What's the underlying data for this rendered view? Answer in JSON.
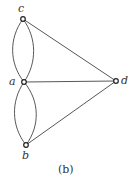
{
  "diagram": {
    "type": "multigraph",
    "caption": "(b)",
    "vertices": [
      {
        "id": "c",
        "label": "c",
        "x": 23,
        "y": 19,
        "lx": 18,
        "ly": 12
      },
      {
        "id": "a",
        "label": "a",
        "x": 24,
        "y": 82,
        "lx": 9,
        "ly": 85
      },
      {
        "id": "d",
        "label": "d",
        "x": 116,
        "y": 81,
        "lx": 121,
        "ly": 84
      },
      {
        "id": "b",
        "label": "b",
        "x": 26,
        "y": 145,
        "lx": 22,
        "ly": 159
      }
    ],
    "edges": [
      {
        "from": "c",
        "to": "a",
        "kind": "curved-left"
      },
      {
        "from": "c",
        "to": "a",
        "kind": "curved-right"
      },
      {
        "from": "a",
        "to": "b",
        "kind": "curved-left"
      },
      {
        "from": "a",
        "to": "b",
        "kind": "curved-right"
      },
      {
        "from": "c",
        "to": "d",
        "kind": "straight"
      },
      {
        "from": "a",
        "to": "d",
        "kind": "straight"
      },
      {
        "from": "b",
        "to": "d",
        "kind": "straight"
      }
    ]
  }
}
